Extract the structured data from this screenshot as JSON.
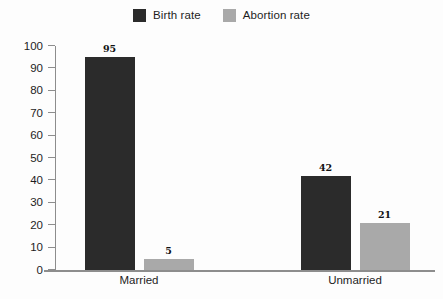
{
  "chart_data": {
    "type": "bar",
    "title": "",
    "subtitle": "",
    "xlabel": "",
    "ylabel": "",
    "categories": [
      "Married",
      "Unmarried"
    ],
    "series": [
      {
        "name": "Birth rate",
        "color": "#2b2b2b",
        "values": [
          95,
          42
        ]
      },
      {
        "name": "Abortion rate",
        "color": "#a9a9a9",
        "values": [
          5,
          21
        ]
      }
    ],
    "ylim": [
      0,
      100
    ],
    "yticks": [
      0,
      10,
      20,
      30,
      40,
      50,
      60,
      70,
      80,
      90,
      100
    ],
    "ytick_labels": [
      "0",
      "10",
      "20",
      "30",
      "40",
      "50",
      "60",
      "70",
      "80",
      "90",
      "100"
    ],
    "grid": false,
    "legend_position": "top-center",
    "data_labels": true
  },
  "legend": {
    "items": [
      {
        "label": "Birth rate",
        "color": "#2b2b2b",
        "swatch_name": "legend-swatch-birth-rate"
      },
      {
        "label": "Abortion rate",
        "color": "#a9a9a9",
        "swatch_name": "legend-swatch-abortion-rate"
      }
    ]
  },
  "axes": {
    "y_labels": [
      "100",
      "90",
      "80",
      "70",
      "60",
      "50",
      "40",
      "30",
      "20",
      "10",
      "0"
    ],
    "x_labels": [
      "Married",
      "Unmarried"
    ]
  },
  "bars": [
    {
      "group": "Married",
      "series": "Birth rate",
      "value": 95,
      "label": "95"
    },
    {
      "group": "Married",
      "series": "Abortion rate",
      "value": 5,
      "label": "5"
    },
    {
      "group": "Unmarried",
      "series": "Birth rate",
      "value": 42,
      "label": "42"
    },
    {
      "group": "Unmarried",
      "series": "Abortion rate",
      "value": 21,
      "label": "21"
    }
  ],
  "colors": {
    "birth_rate": "#2b2b2b",
    "abortion_rate": "#a9a9a9",
    "axis": "#8d8d8d",
    "text": "#1d1d1d",
    "background": "#fdfdfd"
  }
}
